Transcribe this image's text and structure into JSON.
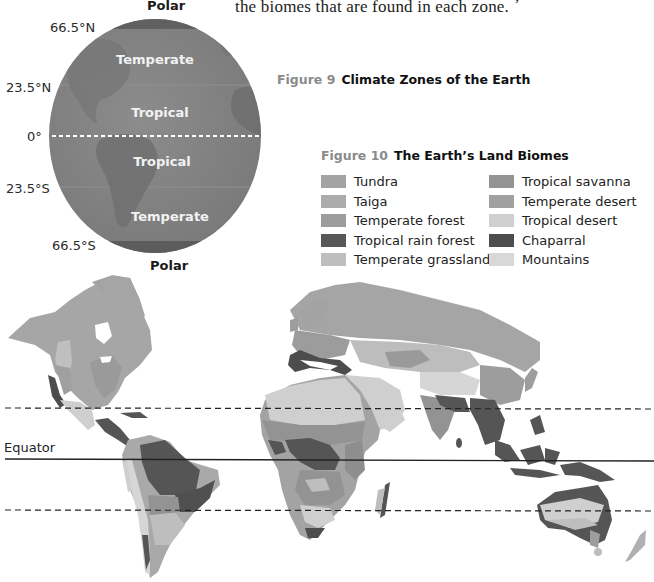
{
  "body_text": {
    "line": "the biomes that are found in each zone.",
    "cut_glyph": ","
  },
  "figure9": {
    "number": "Figure 9",
    "title": "Climate Zones of the Earth",
    "latitude_labels": {
      "n66": "66.5°N",
      "n23": "23.5°N",
      "eq": "0°",
      "s23": "23.5°S",
      "s66": "66.5°S"
    },
    "zones": {
      "polar_north": "Polar",
      "temperate_north": "Temperate",
      "tropical_north": "Tropical",
      "tropical_south": "Tropical",
      "temperate_south": "Temperate",
      "polar_south": "Polar"
    },
    "colors": {
      "globe_fill": "#808080",
      "polar_band": "#5f5f5f",
      "zone_text": "#f2f2f2",
      "equator_dash": "#ffffff"
    }
  },
  "figure10": {
    "number": "Figure 10",
    "title": "The Earth’s Land Biomes",
    "legend": {
      "left": [
        {
          "label": "Tundra",
          "color": "#a3a3a3"
        },
        {
          "label": "Taiga",
          "color": "#ababab"
        },
        {
          "label": "Temperate forest",
          "color": "#9d9d9d"
        },
        {
          "label": "Tropical rain forest",
          "color": "#575757"
        },
        {
          "label": "Temperate grassland",
          "color": "#bebebe"
        }
      ],
      "right": [
        {
          "label": "Tropical savanna",
          "color": "#939393"
        },
        {
          "label": "Temperate desert",
          "color": "#a0a0a0"
        },
        {
          "label": "Tropical desert",
          "color": "#cfcfcf"
        },
        {
          "label": "Chaparral",
          "color": "#4d4d4d"
        },
        {
          "label": "Mountains",
          "color": "#d8d8d8"
        }
      ]
    },
    "map": {
      "equator_label": "Equator",
      "lines": {
        "tropic_north_y": 408,
        "equator_y": 460,
        "tropic_south_y": 511
      }
    }
  }
}
